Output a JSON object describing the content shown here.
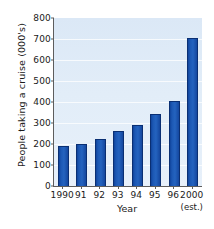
{
  "chart_data": {
    "type": "bar",
    "title": "",
    "xlabel": "Year",
    "ylabel": "People taking a cruise (000's)",
    "categories": [
      "1990",
      "91",
      "92",
      "93",
      "94",
      "95",
      "96",
      "2000"
    ],
    "category_sublabels": [
      "",
      "",
      "",
      "",
      "",
      "",
      "",
      "(est.)"
    ],
    "values": [
      192,
      202,
      222,
      262,
      292,
      343,
      403,
      705
    ],
    "ylim": [
      0,
      800
    ],
    "yticks": [
      0,
      100,
      200,
      300,
      400,
      500,
      600,
      700,
      800
    ],
    "ytick_labels": [
      "0",
      "100",
      "200",
      "300",
      "400",
      "500",
      "600",
      "700",
      "800"
    ],
    "grid": true,
    "grid_axis": "y",
    "legend": false,
    "bar_color": "#1c58b4",
    "bar_edge_color": "#0a2f73",
    "plot_background": "#dfebf7",
    "axis_color": "#5d5d5d",
    "text_color": "#1a1a1a"
  }
}
